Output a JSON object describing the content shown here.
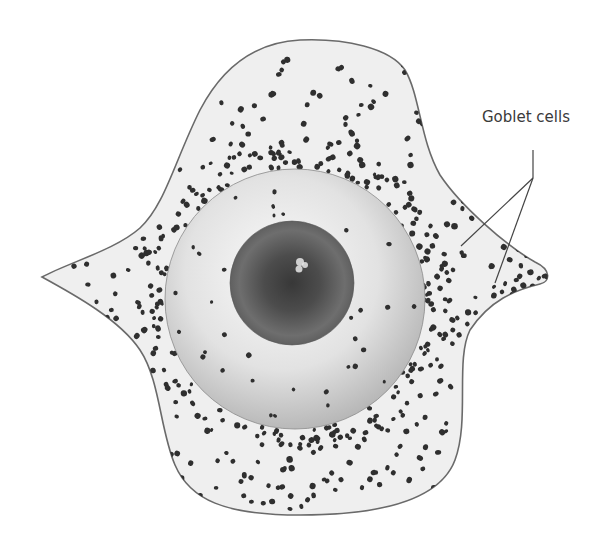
{
  "figure": {
    "background": "#ffffff"
  },
  "labels": [
    {
      "id": "goblet-cells",
      "text": "Goblet cells",
      "x": 482,
      "y": 122
    }
  ],
  "leader": {
    "color": "#444444",
    "stem": [
      [
        533,
        150
      ],
      [
        533,
        178
      ]
    ],
    "branches": [
      [
        [
          533,
          178
        ],
        [
          461,
          246
        ]
      ],
      [
        [
          533,
          178
        ],
        [
          495,
          283
        ]
      ]
    ]
  },
  "conjunctiva": {
    "fill": "#efefef",
    "stroke": "#6a6a6a",
    "left_tip": [
      42,
      277
    ],
    "right_tip": [
      548,
      275
    ],
    "top_y": 40,
    "bottom_y": 515
  },
  "eye": {
    "cx": 295,
    "cy": 299,
    "r": 130,
    "sclera_colors": [
      "#fbfbfb",
      "#dcdcdc",
      "#b8b8b8"
    ],
    "iris": {
      "cx": 292,
      "cy": 283,
      "r": 62,
      "colors": [
        "#3c3c3c",
        "#5a5a5a",
        "#777777"
      ]
    },
    "highlight": {
      "x": 300,
      "y": 262
    }
  },
  "goblet_cells": {
    "color": "#2f2f2f",
    "seed": 7,
    "regions": [
      {
        "name": "sparse-upper",
        "count": 70,
        "density": "low"
      },
      {
        "name": "limbal-ring",
        "count": 180,
        "density": "medium"
      },
      {
        "name": "nasal-cluster",
        "count": 260,
        "density": "high"
      },
      {
        "name": "sparse-lower",
        "count": 110,
        "density": "low"
      },
      {
        "name": "on-cornea",
        "count": 45,
        "density": "low"
      },
      {
        "name": "left-canthus",
        "count": 30,
        "density": "low"
      }
    ]
  }
}
